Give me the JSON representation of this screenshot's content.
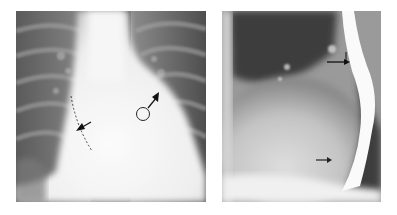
{
  "figure": {
    "panels": [
      {
        "id": "left",
        "description": "Frontal (PA) chest radiograph",
        "annotations": [
          {
            "type": "arrow",
            "label": "",
            "note": "arrow pointing to right heart border marked by dashed line"
          },
          {
            "type": "arrow",
            "label": "①",
            "note": "numbered arrow pointing to left heart border"
          }
        ]
      },
      {
        "id": "right",
        "description": "Lateral chest radiograph with barium-filled esophagus",
        "annotations": [
          {
            "type": "arrow",
            "label": "",
            "note": "upper arrow at esophageal impression"
          },
          {
            "type": "arrow",
            "label": "",
            "note": "lower arrow at posterior heart border"
          }
        ]
      }
    ],
    "callout_label": "①"
  },
  "colors": {
    "background": "#ffffff",
    "film_dark": "#3a3a3a",
    "film_light": "#f4f4f4",
    "annotation": "#111111"
  }
}
